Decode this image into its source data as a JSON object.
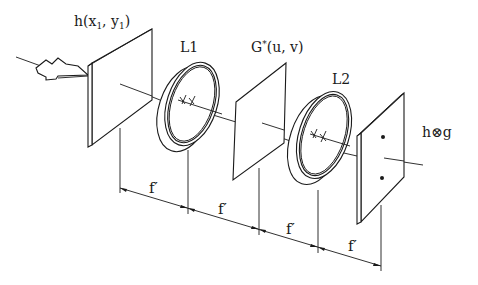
{
  "diagram": {
    "type": "4f optical correlator schematic",
    "labels": {
      "input_plane": "h(x",
      "input_plane_sub1": "1",
      "input_plane_mid": ", y",
      "input_plane_sub2": "1",
      "input_plane_end": ")",
      "lens1": "L1",
      "filter_plane_G": "G",
      "filter_plane_star": "*",
      "filter_plane_args": "(u, v)",
      "lens2": "L2",
      "output_h": "h",
      "output_op": "⊗",
      "output_g": "g"
    },
    "focal_length_label": "f′",
    "dimension_segments": [
      {
        "label": "f′"
      },
      {
        "label": "f′"
      },
      {
        "label": "f′"
      },
      {
        "label": "f′"
      }
    ],
    "components": [
      {
        "name": "input-plane",
        "label": "h(x1, y1)"
      },
      {
        "name": "lens-L1",
        "label": "L1"
      },
      {
        "name": "filter-plane",
        "label": "G*(u, v)"
      },
      {
        "name": "lens-L2",
        "label": "L2"
      },
      {
        "name": "output-plane",
        "label": "h⊗g",
        "features": [
          "two correlation peaks (dots)"
        ]
      }
    ],
    "colors": {
      "ink": "#1a1a1a",
      "background": "#ffffff"
    }
  }
}
